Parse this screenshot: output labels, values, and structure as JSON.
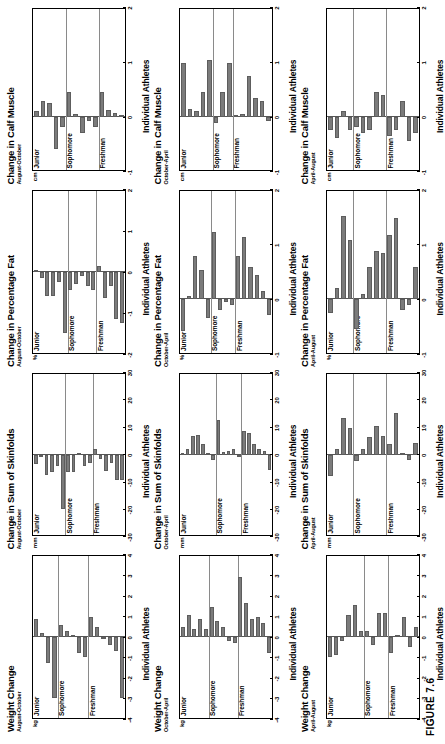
{
  "figure": {
    "caption": "FIGURE 7.6",
    "xlabel": "Individual Athletes",
    "bar_color": "#7b7b7b",
    "grade_groups": [
      "Freshman",
      "Sophomore",
      "Junior"
    ]
  },
  "chart_data": [
    {
      "type": "bar",
      "title": "Weight Change",
      "subtitle": "August-October",
      "ylabel": "kg",
      "xlabel": "Individual Athletes",
      "ylim": [
        -4,
        4
      ],
      "yticks": [
        4,
        3,
        2,
        1,
        0,
        -1,
        -2,
        -3,
        -4
      ],
      "groups": [
        "Freshman",
        "Sophomore",
        "Junior"
      ],
      "categories": [
        "Freshman",
        "Sophomore",
        "Junior"
      ],
      "series": [
        {
          "name": "Freshman",
          "values": [
            -3.0,
            -0.7,
            -0.4,
            -0.1,
            0.5,
            1.0
          ]
        },
        {
          "name": "Sophomore",
          "values": [
            -1.0,
            -0.8,
            0.1,
            0.3,
            0.6
          ]
        },
        {
          "name": "Junior",
          "values": [
            -3.0,
            -1.3,
            0.2,
            0.9
          ]
        }
      ],
      "values": [
        -3.0,
        -0.7,
        -0.4,
        -0.1,
        0.5,
        1.0,
        -1.0,
        -0.8,
        0.1,
        0.3,
        0.6,
        -3.0,
        -1.3,
        0.2,
        0.9
      ]
    },
    {
      "type": "bar",
      "title": "Change in Sum of Skinfolds",
      "subtitle": "August-October",
      "ylabel": "mm",
      "xlabel": "Individual Athletes",
      "ylim": [
        -30,
        30
      ],
      "yticks": [
        30,
        20,
        10,
        0,
        -10,
        -20,
        -30
      ],
      "groups": [
        "Freshman",
        "Sophomore",
        "Junior"
      ],
      "categories": [
        "Freshman",
        "Sophomore",
        "Junior"
      ],
      "series": [
        {
          "name": "Freshman",
          "values": [
            -9.5,
            -9.5,
            -3.0,
            -6.0,
            -1.5,
            2.0
          ]
        },
        {
          "name": "Sophomore",
          "values": [
            -3.0,
            -4.0,
            0.5,
            -6.5,
            -6.5
          ]
        },
        {
          "name": "Junior",
          "values": [
            -20.0,
            -4.0,
            -6.5,
            -7.5,
            -1.0,
            -3.5
          ]
        }
      ],
      "values": [
        -9.5,
        -9.5,
        -3.0,
        -6.0,
        -1.5,
        2.0,
        -3.0,
        -4.0,
        0.5,
        -6.5,
        -6.5,
        -20.0,
        -4.0,
        -6.5,
        -7.5,
        -1.0,
        -3.5
      ]
    },
    {
      "type": "bar",
      "title": "Change in Percentage Fat",
      "subtitle": "August-October",
      "ylabel": "%",
      "xlabel": "Individual Athletes",
      "ylim": [
        -2,
        2
      ],
      "yticks": [
        2,
        1,
        0,
        -1,
        -2
      ],
      "groups": [
        "Freshman",
        "Sophomore",
        "Junior"
      ],
      "categories": [
        "Freshman",
        "Sophomore",
        "Junior"
      ],
      "series": [
        {
          "name": "Freshman",
          "values": [
            -1.25,
            -1.15,
            -0.35,
            -0.65,
            0.15
          ]
        },
        {
          "name": "Sophomore",
          "values": [
            -0.45,
            -0.35,
            -0.1,
            -0.3,
            -0.45
          ]
        },
        {
          "name": "Junior",
          "values": [
            -1.5,
            -0.25,
            -0.6,
            -0.6,
            -0.15,
            0.02
          ]
        }
      ],
      "values": [
        -1.25,
        -1.15,
        -0.35,
        -0.65,
        0.15,
        -0.45,
        -0.35,
        -0.1,
        -0.3,
        -0.45,
        -1.5,
        -0.25,
        -0.6,
        -0.6,
        -0.15,
        0.02
      ]
    },
    {
      "type": "bar",
      "title": "Change in Calf Muscle",
      "subtitle": "August-October",
      "ylabel": "cm",
      "xlabel": "Individual Athletes",
      "ylim": [
        -1,
        2
      ],
      "yticks": [
        2,
        1,
        0,
        -1
      ],
      "groups": [
        "Freshman",
        "Sophomore",
        "Junior"
      ],
      "categories": [
        "Freshman",
        "Sophomore",
        "Junior"
      ],
      "series": [
        {
          "name": "Freshman",
          "values": [
            0.02,
            0.06,
            0.12,
            0.45
          ]
        },
        {
          "name": "Sophomore",
          "values": [
            -0.2,
            -0.08,
            -0.3,
            0.05,
            0.45
          ]
        },
        {
          "name": "Junior",
          "values": [
            -0.2,
            -0.6,
            0.25,
            0.3,
            0.1
          ]
        }
      ],
      "values": [
        0.02,
        0.06,
        0.12,
        0.45,
        -0.2,
        -0.08,
        -0.3,
        0.05,
        0.45,
        -0.2,
        -0.6,
        0.25,
        0.3,
        0.1
      ]
    },
    {
      "type": "bar",
      "title": "Weight Change",
      "subtitle": "October-April",
      "ylabel": "kg",
      "xlabel": "Individual Athletes",
      "ylim": [
        -4,
        4
      ],
      "yticks": [
        4,
        3,
        2,
        1,
        0,
        -1,
        -2,
        -3,
        -4
      ],
      "groups": [
        "Freshman",
        "Sophomore",
        "Junior"
      ],
      "categories": [
        "Freshman",
        "Sophomore",
        "Junior"
      ],
      "series": [
        {
          "name": "Freshman",
          "values": [
            -0.8,
            0.7,
            1.0,
            0.9,
            1.7,
            3.0
          ]
        },
        {
          "name": "Sophomore",
          "values": [
            -0.3,
            -0.2,
            0.5,
            0.8,
            1.5
          ]
        },
        {
          "name": "Junior",
          "values": [
            0.4,
            0.9,
            0.4,
            1.1,
            0.5
          ]
        }
      ],
      "values": [
        -0.8,
        0.7,
        1.0,
        0.9,
        1.7,
        3.0,
        -0.3,
        -0.2,
        0.5,
        0.8,
        1.5,
        0.4,
        0.9,
        0.4,
        1.1,
        0.5
      ]
    },
    {
      "type": "bar",
      "title": "Change in Sum of Skinfolds",
      "subtitle": "October-April",
      "ylabel": "mm",
      "xlabel": "Individual Athletes",
      "ylim": [
        -30,
        30
      ],
      "yticks": [
        30,
        20,
        10,
        0,
        -10,
        -20,
        -30
      ],
      "groups": [
        "Freshman",
        "Sophomore",
        "Junior"
      ],
      "categories": [
        "Freshman",
        "Sophomore",
        "Junior"
      ],
      "series": [
        {
          "name": "Freshman",
          "values": [
            -5.5,
            1.5,
            2.0,
            4.0,
            8.0,
            9.0
          ]
        },
        {
          "name": "Sophomore",
          "values": [
            -1.0,
            2.0,
            1.5,
            1.0,
            13.0
          ]
        },
        {
          "name": "Junior",
          "values": [
            -2.0,
            0.5,
            4.0,
            7.5,
            7.0,
            2.0,
            0.5
          ]
        }
      ],
      "values": [
        -5.5,
        1.5,
        2.0,
        4.0,
        8.0,
        9.0,
        -1.0,
        2.0,
        1.5,
        1.0,
        13.0,
        -2.0,
        0.5,
        4.0,
        7.5,
        7.0,
        2.0,
        0.5
      ]
    },
    {
      "type": "bar",
      "title": "Change in Percentage Fat",
      "subtitle": "October-April",
      "ylabel": "%",
      "xlabel": "Individual Athletes",
      "ylim": [
        -1,
        2
      ],
      "yticks": [
        2,
        1,
        0,
        -1
      ],
      "groups": [
        "Freshman",
        "Sophomore",
        "Junior"
      ],
      "categories": [
        "Freshman",
        "Sophomore",
        "Junior"
      ],
      "series": [
        {
          "name": "Freshman",
          "values": [
            -0.3,
            0.15,
            0.45,
            0.6,
            1.15,
            0.8
          ]
        },
        {
          "name": "Sophomore",
          "values": [
            -0.1,
            -0.05,
            -0.2,
            1.25
          ]
        },
        {
          "name": "Junior",
          "values": [
            -0.35,
            0.55,
            0.8,
            0.05,
            -0.6
          ]
        }
      ],
      "values": [
        -0.3,
        0.15,
        0.45,
        0.6,
        1.15,
        0.8,
        -0.1,
        -0.05,
        -0.2,
        1.25,
        -0.35,
        0.55,
        0.8,
        0.05,
        -0.6
      ]
    },
    {
      "type": "bar",
      "title": "Change in Calf Muscle",
      "subtitle": "October-April",
      "ylabel": "cm",
      "xlabel": "Individual Athletes",
      "ylim": [
        -1,
        2
      ],
      "yticks": [
        2,
        1,
        0,
        -1
      ],
      "groups": [
        "Freshman",
        "Sophomore",
        "Junior"
      ],
      "categories": [
        "Freshman",
        "Sophomore",
        "Junior"
      ],
      "series": [
        {
          "name": "Freshman",
          "values": [
            -0.08,
            0.3,
            0.35,
            0.75,
            0.05,
            0.02
          ]
        },
        {
          "name": "Sophomore",
          "values": [
            1.0,
            0.45,
            -0.12
          ]
        },
        {
          "name": "Junior",
          "values": [
            1.05,
            0.45,
            0.1,
            0.15,
            1.0
          ]
        }
      ],
      "values": [
        -0.08,
        0.3,
        0.35,
        0.75,
        0.05,
        0.02,
        1.0,
        0.45,
        -0.12,
        1.05,
        0.45,
        0.1,
        0.15,
        1.0
      ]
    },
    {
      "type": "bar",
      "title": "Weight Change",
      "subtitle": "April-August",
      "ylabel": "kg",
      "xlabel": "Individual Athletes",
      "ylim": [
        -4,
        4
      ],
      "yticks": [
        4,
        3,
        2,
        1,
        0,
        -1,
        -2,
        -3,
        -4
      ],
      "groups": [
        "Freshman",
        "Sophomore",
        "Junior"
      ],
      "categories": [
        "Freshman",
        "Sophomore",
        "Junior"
      ],
      "series": [
        {
          "name": "Freshman",
          "values": [
            0.5,
            -0.5,
            1.0,
            0.1,
            -0.8
          ]
        },
        {
          "name": "Sophomore",
          "values": [
            1.2,
            1.2,
            -0.4,
            0.3
          ]
        },
        {
          "name": "Junior",
          "values": [
            0.3,
            1.6,
            1.1,
            -0.2,
            -0.9,
            -1.0
          ]
        }
      ],
      "values": [
        0.5,
        -0.5,
        1.0,
        0.1,
        -0.8,
        1.2,
        1.2,
        -0.4,
        0.3,
        0.3,
        1.6,
        1.1,
        -0.2,
        -0.9,
        -1.0
      ]
    },
    {
      "type": "bar",
      "title": "Change in Sum of Skinfolds",
      "subtitle": "April-August",
      "ylabel": "mm",
      "xlabel": "Individual Athletes",
      "ylim": [
        -30,
        30
      ],
      "yticks": [
        30,
        20,
        10,
        0,
        -10,
        -20,
        -30
      ],
      "groups": [
        "Freshman",
        "Sophomore",
        "Junior"
      ],
      "categories": [
        "Freshman",
        "Sophomore",
        "Junior"
      ],
      "series": [
        {
          "name": "Freshman",
          "values": [
            4.5,
            -2.0,
            0.5,
            15.5,
            4.0
          ]
        },
        {
          "name": "Sophomore",
          "values": [
            7.0,
            10.5,
            6.5,
            2.0,
            -2.5
          ]
        },
        {
          "name": "Junior",
          "values": [
            10.0,
            13.5,
            2.0,
            -8.0
          ]
        }
      ],
      "values": [
        4.5,
        -2.0,
        0.5,
        15.5,
        4.0,
        7.0,
        10.5,
        6.5,
        2.0,
        -2.5,
        10.0,
        13.5,
        2.0,
        -8.0
      ]
    },
    {
      "type": "bar",
      "title": "Change in Percentage Fat",
      "subtitle": "April-August",
      "ylabel": "%",
      "xlabel": "Individual Athletes",
      "ylim": [
        -1,
        2
      ],
      "yticks": [
        2,
        1,
        0,
        -1
      ],
      "groups": [
        "Freshman",
        "Sophomore",
        "Junior"
      ],
      "categories": [
        "Freshman",
        "Sophomore",
        "Junior"
      ],
      "series": [
        {
          "name": "Freshman",
          "values": [
            0.6,
            -0.1,
            -0.2,
            1.5,
            1.2
          ]
        },
        {
          "name": "Sophomore",
          "values": [
            0.85,
            0.9,
            0.6,
            0.1,
            -0.55
          ]
        },
        {
          "name": "Junior",
          "values": [
            1.1,
            1.55,
            0.2,
            -0.25
          ]
        }
      ],
      "values": [
        0.6,
        -0.1,
        -0.2,
        1.5,
        1.2,
        0.85,
        0.9,
        0.6,
        0.1,
        -0.55,
        1.1,
        1.55,
        0.2,
        -0.25
      ]
    },
    {
      "type": "bar",
      "title": "Change in Calf Muscle",
      "subtitle": "April-August",
      "ylabel": "cm",
      "xlabel": "Individual Athletes",
      "ylim": [
        -1,
        2
      ],
      "yticks": [
        2,
        1,
        0,
        -1
      ],
      "groups": [
        "Freshman",
        "Sophomore",
        "Junior"
      ],
      "categories": [
        "Freshman",
        "Sophomore",
        "Junior"
      ],
      "series": [
        {
          "name": "Freshman",
          "values": [
            -0.3,
            -0.45,
            0.3,
            -0.25,
            -0.35
          ]
        },
        {
          "name": "Sophomore",
          "values": [
            0.4,
            0.45,
            -0.25,
            -0.3,
            -0.2
          ]
        },
        {
          "name": "Junior",
          "values": [
            -0.25,
            0.1,
            -0.4,
            -0.25
          ]
        }
      ],
      "values": [
        -0.3,
        -0.45,
        0.3,
        -0.25,
        -0.35,
        0.4,
        0.45,
        -0.25,
        -0.3,
        -0.2,
        -0.25,
        0.1,
        -0.4,
        -0.25
      ]
    }
  ]
}
